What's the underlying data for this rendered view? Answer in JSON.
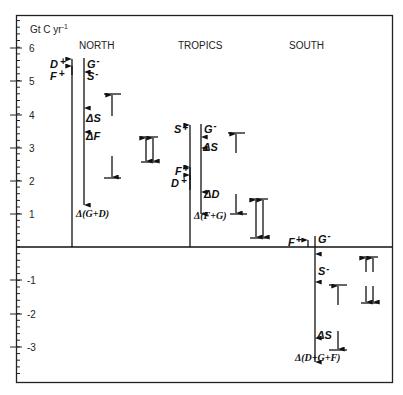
{
  "chart_data": {
    "type": "bar",
    "title": "",
    "ylabel": "Gt C yr-1",
    "unit_label": {
      "base": "Gt C yr",
      "sup": "-1"
    },
    "ylim": [
      -4,
      6.5
    ],
    "yticks": [
      6,
      5,
      4,
      3,
      2,
      1,
      -1,
      -2,
      -3
    ],
    "ytick_labels": [
      "6",
      "5",
      "4",
      "3",
      "2",
      "1",
      "-1",
      "-2",
      "-3"
    ],
    "grid": false,
    "regions": [
      {
        "name": "NORTH",
        "sources": {
          "total": 5.75,
          "labels": [
            "D+",
            "F+"
          ]
        },
        "sinks": {
          "top": 5.7,
          "labels_top": [
            "G-",
            "S-"
          ],
          "steps": [
            {
              "label": "ΔS",
              "value": 4.1
            },
            {
              "label": "ΔF",
              "value": 3.4
            }
          ],
          "end": {
            "label": "Δ(G+D)",
            "value": 1.25
          }
        },
        "uncertainty_bar": {
          "upper": 4.6,
          "lower": 2.1
        },
        "double_bar": {
          "upper": 3.3,
          "lower": 2.55
        }
      },
      {
        "name": "TROPICS",
        "sources": {
          "total": 3.65,
          "labels": [
            "S+",
            "F+",
            "D+"
          ],
          "steps": [
            {
              "label": "F+",
              "value": 2.4
            },
            {
              "label": "D+",
              "value": 2.2
            }
          ]
        },
        "sinks": {
          "top": 3.7,
          "labels_top": [
            "G-"
          ],
          "steps": [
            {
              "label": "ΔS",
              "value": 3.0
            },
            {
              "label": "ΔD",
              "value": 1.4
            }
          ],
          "end": {
            "label": "Δ(F+G)",
            "value": 0.85
          }
        },
        "uncertainty_bar": {
          "upper": 3.45,
          "lower": 0.95
        },
        "double_bar": {
          "upper": 1.45,
          "lower": 0.25
        }
      },
      {
        "name": "SOUTH",
        "sources": {
          "total": 0.25,
          "labels": [
            "F+"
          ]
        },
        "sinks": {
          "top": 0.3,
          "labels_top": [
            "G-"
          ],
          "steps": [
            {
              "label": "S-",
              "value": -1.0
            },
            {
              "label": "ΔS",
              "value": -2.7
            }
          ],
          "end": {
            "label": "Δ(D+G+F)",
            "value": -3.45
          }
        },
        "uncertainty_bar": {
          "upper": -1.15,
          "lower": -3.1
        },
        "double_bar": {
          "upper": -0.3,
          "lower": -1.65
        }
      }
    ]
  },
  "axis": {
    "unit_base": "Gt C yr",
    "unit_sup": "-1"
  },
  "labels": {
    "north": "NORTH",
    "tropics": "TROPICS",
    "south": "SOUTH",
    "north_D": "D",
    "north_F": "F",
    "north_G": "G",
    "north_S": "S",
    "north_dS": "ΔS",
    "north_dF": "ΔF",
    "north_end": "Δ(G+D)",
    "tropics_S": "S",
    "tropics_F": "F",
    "tropics_D": "D",
    "tropics_G": "G",
    "tropics_dS": "ΔS",
    "tropics_dD": "ΔD",
    "tropics_end": "Δ(F+G)",
    "south_F": "F",
    "south_G": "G",
    "south_S": "S",
    "south_dS": "ΔS",
    "south_end": "Δ(D+G+F)",
    "plus": "+",
    "minus": "-"
  }
}
